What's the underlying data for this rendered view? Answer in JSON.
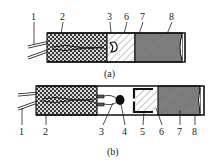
{
  "figure_a": {
    "caption": "(a)",
    "labels": [
      "1",
      "2",
      "3",
      "6",
      "7",
      "8"
    ]
  },
  "figure_b": {
    "caption": "(b)",
    "labels": [
      "1",
      "2",
      "3",
      "4",
      "5",
      "6",
      "7",
      "8"
    ]
  },
  "colors": {
    "outline": "#1a1a1a",
    "checker_dark": "#3a3a3a",
    "hatch_light": "#888888",
    "dense_fill": "#6a6a6a"
  }
}
